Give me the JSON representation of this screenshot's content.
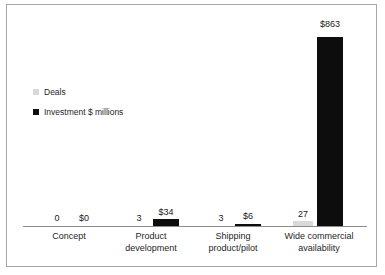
{
  "chart_data": {
    "type": "bar",
    "title": "",
    "subtitle": "",
    "xlabel": "",
    "ylabel": "",
    "grid": false,
    "legend_position": "inside-left",
    "categories": [
      "Concept",
      "Product development",
      "Shipping product/pilot",
      "Wide commercial availability"
    ],
    "category_lines": [
      [
        "Concept"
      ],
      [
        "Product",
        "development"
      ],
      [
        "Shipping",
        "product/pilot"
      ],
      [
        "Wide commercial",
        "availability"
      ]
    ],
    "series": [
      {
        "name": "Deals",
        "color": "#d9d9d9",
        "values": [
          0,
          3,
          3,
          27
        ],
        "labels": [
          "0",
          "3",
          "3",
          "27"
        ]
      },
      {
        "name": "Investment $ millions",
        "color": "#0d0d0d",
        "values": [
          0,
          34,
          6,
          863
        ],
        "labels": [
          "$0",
          "$34",
          "$6",
          "$863"
        ]
      }
    ],
    "ylim": [
      0,
      863
    ]
  },
  "legend": {
    "items": [
      {
        "label": "Deals",
        "color": "#d9d9d9"
      },
      {
        "label": "Investment $ millions",
        "color": "#0d0d0d"
      }
    ]
  },
  "bars": [
    {
      "label": "0",
      "x": 40,
      "w": 20,
      "h": 0,
      "label_x": 34,
      "label_y": 208
    },
    {
      "label": "$0",
      "x": 64,
      "w": 26,
      "h": 0,
      "label_x": 58,
      "label_y": 208
    },
    {
      "label": "3",
      "x": 122,
      "w": 20,
      "h": 0,
      "label_x": 116,
      "label_y": 208
    },
    {
      "label": "$34",
      "x": 146,
      "w": 26,
      "h": 8,
      "label_x": 140,
      "label_y": 202
    },
    {
      "label": "3",
      "x": 204,
      "w": 20,
      "h": 0,
      "label_x": 198,
      "label_y": 208
    },
    {
      "label": "$6",
      "x": 228,
      "w": 26,
      "h": 3,
      "label_x": 222,
      "label_y": 206
    },
    {
      "label": "27",
      "x": 286,
      "w": 20,
      "h": 6,
      "label_x": 280,
      "label_y": 204
    },
    {
      "label": "$863",
      "x": 310,
      "w": 26,
      "h": 190,
      "label_x": 304,
      "label_y": 14
    }
  ],
  "category_positions": [
    {
      "left": 16,
      "width": 92
    },
    {
      "left": 98,
      "width": 92
    },
    {
      "left": 180,
      "width": 92
    },
    {
      "left": 258,
      "width": 108
    }
  ]
}
